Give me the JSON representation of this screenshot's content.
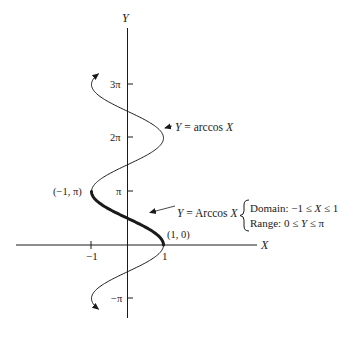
{
  "figure": {
    "type": "inverse-trig-graph",
    "axes": {
      "x_label": "X",
      "y_label": "Y",
      "x_ticks": [
        {
          "value": -1,
          "label": "−1"
        },
        {
          "value": 1,
          "label": "1"
        }
      ],
      "y_ticks": [
        {
          "value_pi": 3,
          "label": "3π"
        },
        {
          "value_pi": 2,
          "label": "2π"
        },
        {
          "value_pi": 1,
          "label": "π"
        },
        {
          "value_pi": -1,
          "label": "−π"
        }
      ]
    },
    "curves": {
      "relation": {
        "label_var": "Y",
        "label_eq": " = arccos ",
        "label_arg": "X",
        "y_range_pi": [
          -1.2,
          3.2
        ],
        "style": "thin"
      },
      "principal": {
        "label_var": "Y",
        "label_eq": " = Arccos ",
        "label_arg": "X",
        "y_range_pi": [
          0,
          1
        ],
        "style": "bold"
      }
    },
    "points": [
      {
        "label": "(−1, π)",
        "x": -1,
        "y_pi": 1
      },
      {
        "label": "(1, 0)",
        "x": 1,
        "y_pi": 0
      }
    ],
    "annotation": {
      "domain_label": "Domain: −1 ≤ ",
      "domain_var": "X",
      "domain_tail": " ≤ 1",
      "range_label": "Range: 0 ≤ ",
      "range_var": "Y",
      "range_tail": " ≤ π"
    },
    "colors": {
      "ink": "#1a1a1a",
      "background": "#ffffff"
    }
  }
}
